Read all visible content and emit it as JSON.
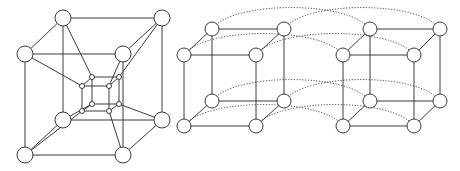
{
  "figure": {
    "panels": [
      {
        "id": "tesseract",
        "description": "Hypercube (tesseract) projection: outer cube with inner cube connected at corresponding vertices",
        "outer_nodes": [
          [
            63,
            18
          ],
          [
            162,
            18
          ],
          [
            25,
            54
          ],
          [
            123,
            54
          ],
          [
            63,
            120
          ],
          [
            162,
            120
          ],
          [
            25,
            155
          ],
          [
            123,
            155
          ]
        ],
        "inner_nodes": [
          [
            92,
            77
          ],
          [
            119,
            77
          ],
          [
            82,
            86
          ],
          [
            109,
            86
          ],
          [
            92,
            104
          ],
          [
            119,
            104
          ],
          [
            82,
            111
          ],
          [
            109,
            111
          ]
        ],
        "outer_radius": 8,
        "inner_radius": 2.5
      },
      {
        "id": "cube-pair",
        "description": "Two cubes side by side with corresponding vertices linked by dotted arcs",
        "left_cube": [
          [
            212,
            29
          ],
          [
            284,
            29
          ],
          [
            184,
            55
          ],
          [
            256,
            55
          ],
          [
            212,
            101
          ],
          [
            284,
            101
          ],
          [
            184,
            126
          ],
          [
            256,
            126
          ]
        ],
        "right_cube": [
          [
            370,
            29
          ],
          [
            440,
            29
          ],
          [
            343,
            55
          ],
          [
            414,
            55
          ],
          [
            370,
            101
          ],
          [
            440,
            101
          ],
          [
            343,
            126
          ],
          [
            414,
            126
          ]
        ],
        "node_radius": 7,
        "arc_lift": 22
      }
    ],
    "colors": {
      "line": "#3a3a3a",
      "dotted": "#555555",
      "node_fill": "#ffffff",
      "background": "#ffffff"
    }
  }
}
